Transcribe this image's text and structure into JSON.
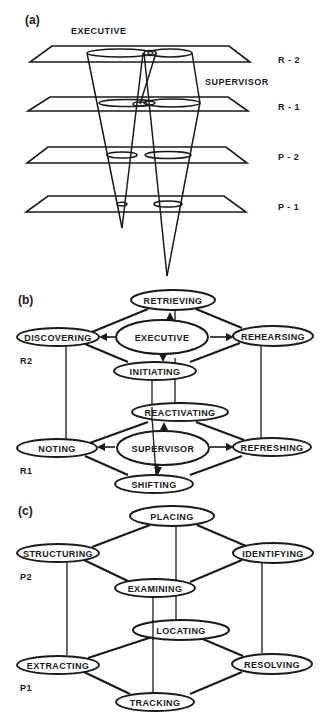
{
  "figure": {
    "panel_a": {
      "label": "(a)",
      "executive_label": "EXECUTIVE",
      "supervisor_label": "SUPERVISOR",
      "levels": [
        "R - 2",
        "R - 1",
        "P - 2",
        "P - 1"
      ]
    },
    "panel_b": {
      "label": "(b)",
      "level_upper": "R2",
      "level_lower": "R1",
      "nodes": {
        "retrieving": "RETRIEVING",
        "discovering": "DISCOVERING",
        "executive": "EXECUTIVE",
        "rehearsing": "REHEARSING",
        "initiating": "INITIATING",
        "reactivating": "REACTIVATING",
        "noting": "NOTING",
        "supervisor": "SUPERVISOR",
        "refreshing": "REFRESHING",
        "shifting": "SHIFTING"
      }
    },
    "panel_c": {
      "label": "(c)",
      "level_upper": "P2",
      "level_lower": "P1",
      "nodes": {
        "placing": "PLACING",
        "structuring": "STRUCTURING",
        "identifying": "IDENTIFYING",
        "examining": "EXAMINING",
        "locating": "LOCATING",
        "extracting": "EXTRACTING",
        "resolving": "RESOLVING",
        "tracking": "TRACKING"
      }
    }
  }
}
